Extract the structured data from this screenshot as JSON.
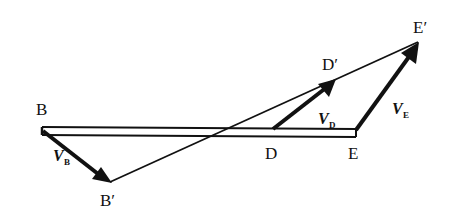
{
  "diagram": {
    "points": {
      "B": "B",
      "B_prime": "B′",
      "D": "D",
      "D_prime": "D′",
      "E": "E",
      "E_prime": "E′"
    },
    "vectors": {
      "VB": {
        "symbol": "V",
        "subscript": "B"
      },
      "VD": {
        "symbol": "V",
        "subscript": "D"
      },
      "VE": {
        "symbol": "V",
        "subscript": "E"
      }
    },
    "colors": {
      "ink": "#111111",
      "background": "#ffffff"
    }
  }
}
